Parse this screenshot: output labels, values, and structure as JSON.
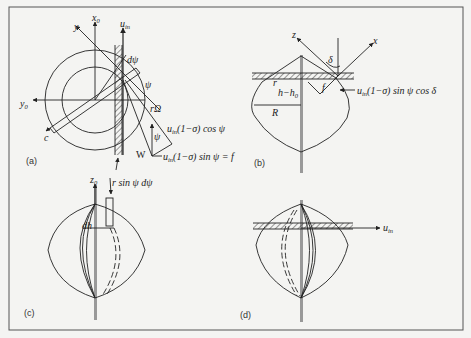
{
  "figure": {
    "border_color": "#555555",
    "background": "#f4f4f2",
    "line_color": "#222222"
  },
  "panel_a": {
    "label": "(a)",
    "axis_x0": "x",
    "axis_x0_sub": "0",
    "axis_y0": "y",
    "axis_y0_sub": "0",
    "axis_y": "y",
    "u_in": "u",
    "u_in_sub": "in",
    "d_psi": "dψ",
    "psi": "ψ",
    "r_omega": "rΩ",
    "chord": "c",
    "W": "W",
    "cos_component": "(1−σ) cos ψ",
    "cos_u": "u",
    "cos_u_sub": "in",
    "sin_component": "(1−σ) sin ψ = f",
    "sin_u": "u",
    "sin_u_sub": "in",
    "psi_small": "ψ",
    "f_marker": "f"
  },
  "panel_b": {
    "label": "(b)",
    "axis_z": "z",
    "axis_x": "x",
    "delta": "δ",
    "r": "r",
    "h_minus_h0": "h−h",
    "h0_sub": "0",
    "R": "R",
    "f": "f",
    "force_u": "u",
    "force_u_sub": "in",
    "force_text": "(1−σ) sin ψ cos δ"
  },
  "panel_c": {
    "label": "(c)",
    "axis_z0": "z",
    "axis_z0_sub": "0",
    "r_sin": "r sin ψ dψ",
    "dh": "dh"
  },
  "panel_d": {
    "label": "(d)",
    "u_in": "u",
    "u_in_sub": "in"
  }
}
